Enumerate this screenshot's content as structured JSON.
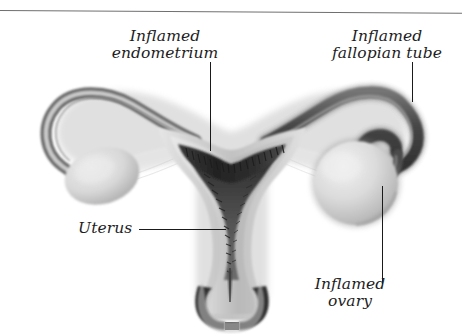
{
  "figure": {
    "style": "grayscale medical illustration, italic serif labels, thin rule across top",
    "width": 462,
    "height": 334,
    "background_color": "#ffffff",
    "line_color": "#1a1a1a",
    "rule_color": "#6f6f6f"
  },
  "labels": {
    "endometrium": {
      "line1": "Inflamed",
      "line2": "endometrium"
    },
    "fallopian": {
      "line1": "Inflamed",
      "line2": "fallopian tube"
    },
    "uterus": {
      "line1": "Uterus"
    },
    "ovary": {
      "line1": "Inflamed",
      "line2": "ovary"
    }
  },
  "leaders": {
    "endometrium": "vertical line from label down to the dark thickened endometrial lining",
    "fallopian": "vertical line from label down to the coiled right fallopian tube",
    "ovary": "vertical line from the right ovary down to the label",
    "uterus": "horizontal line from the label right to the uterine cavity"
  },
  "anatomy": {
    "parts": [
      "left fallopian tube",
      "left ovary",
      "uterine fundus",
      "inflamed endometrium",
      "myometrium",
      "uterine cavity",
      "cervix",
      "right fallopian tube (inflamed, coiled and thickened)",
      "right ovary (inflamed, enlarged)"
    ],
    "tones": {
      "outer_wall": "#d2d2d2",
      "mid_wall": "#a9a9a9",
      "cavity_dark": "#4a4a4a",
      "endometrium_dark": "#2c2c2c",
      "ovary_light": "#dcdcdc",
      "ovary_shadow": "#9a9a9a",
      "tube_dark": "#5b5b5b"
    }
  }
}
